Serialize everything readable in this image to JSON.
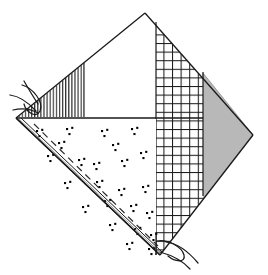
{
  "figure": {
    "canvas": {
      "width": 268,
      "height": 275
    },
    "background_color": "#ffffff",
    "line_color": "#1a1a1a"
  },
  "palette": {
    "outline": "#1a1a1a",
    "grid_hatch": "#1a1a1a",
    "vertical_hatch": "#2b2b2b",
    "gray_fill": "#b8b8b8",
    "gray_fill_edge": "#8f8f8f",
    "stipple_dot": "#000000",
    "white_fill": "#ffffff",
    "dashed_line": "#2b2b2b"
  },
  "geometry": {
    "diamond_vertices": {
      "top": {
        "x": 145,
        "y": 13
      },
      "right": {
        "x": 253,
        "y": 135
      },
      "bottom": {
        "x": 160,
        "y": 255
      },
      "left": {
        "x": 16,
        "y": 118
      }
    },
    "horizontal_divider_y": 118,
    "vertical_hatch_right_edge_x": 84,
    "grid_left_edge_x": 156,
    "grid_right_edge_x": 203
  },
  "regions": [
    {
      "id": "region-vertical-hatch",
      "label": "Vertical line hatch wedge",
      "pattern": "vertical-lines",
      "fill": "#ffffff",
      "stroke": "#2b2b2b"
    },
    {
      "id": "region-upper-white",
      "label": "Upper blank panel",
      "pattern": "none",
      "fill": "#ffffff",
      "stroke": "#1a1a1a"
    },
    {
      "id": "region-cross-hatch",
      "label": "Cross hatch grid band",
      "pattern": "grid",
      "fill": "#ffffff",
      "stroke": "#1a1a1a"
    },
    {
      "id": "region-gray-fill",
      "label": "Solid gray triangle",
      "pattern": "solid",
      "fill": "#b8b8b8",
      "stroke": "#8f8f8f"
    },
    {
      "id": "region-stipple",
      "label": "Stippled aggregate panel",
      "pattern": "dot-clusters",
      "fill": "#ffffff",
      "stroke": "#000000"
    }
  ],
  "annotations": {
    "break_marks": [
      {
        "id": "break-mark-left",
        "label": "Break line symbol (upper left)",
        "x": 30,
        "y": 98
      },
      {
        "id": "break-mark-bottom",
        "label": "Break line symbol (lower right)",
        "x": 172,
        "y": 247
      }
    ],
    "dashed_fold_line": {
      "id": "dashed-fold-line",
      "label": "Dashed centre fold line",
      "from": {
        "x": 34,
        "y": 124
      },
      "to": {
        "x": 158,
        "y": 246
      }
    },
    "double_edge": {
      "id": "double-edge-line",
      "label": "Double thickness left edge",
      "from": {
        "x": 18,
        "y": 120
      },
      "to": {
        "x": 158,
        "y": 252
      }
    }
  },
  "stipple_dot_clusters": [
    {
      "x": 36,
      "y": 130
    },
    {
      "x": 66,
      "y": 128
    },
    {
      "x": 101,
      "y": 130
    },
    {
      "x": 131,
      "y": 128
    },
    {
      "x": 47,
      "y": 155
    },
    {
      "x": 78,
      "y": 159
    },
    {
      "x": 93,
      "y": 163
    },
    {
      "x": 121,
      "y": 160
    },
    {
      "x": 140,
      "y": 152
    },
    {
      "x": 64,
      "y": 182
    },
    {
      "x": 96,
      "y": 181
    },
    {
      "x": 118,
      "y": 189
    },
    {
      "x": 142,
      "y": 186
    },
    {
      "x": 82,
      "y": 206
    },
    {
      "x": 104,
      "y": 200
    },
    {
      "x": 130,
      "y": 205
    },
    {
      "x": 146,
      "y": 212
    },
    {
      "x": 109,
      "y": 224
    },
    {
      "x": 134,
      "y": 228
    },
    {
      "x": 150,
      "y": 234
    },
    {
      "x": 126,
      "y": 243
    },
    {
      "x": 148,
      "y": 248
    },
    {
      "x": 58,
      "y": 142
    },
    {
      "x": 112,
      "y": 144
    }
  ]
}
